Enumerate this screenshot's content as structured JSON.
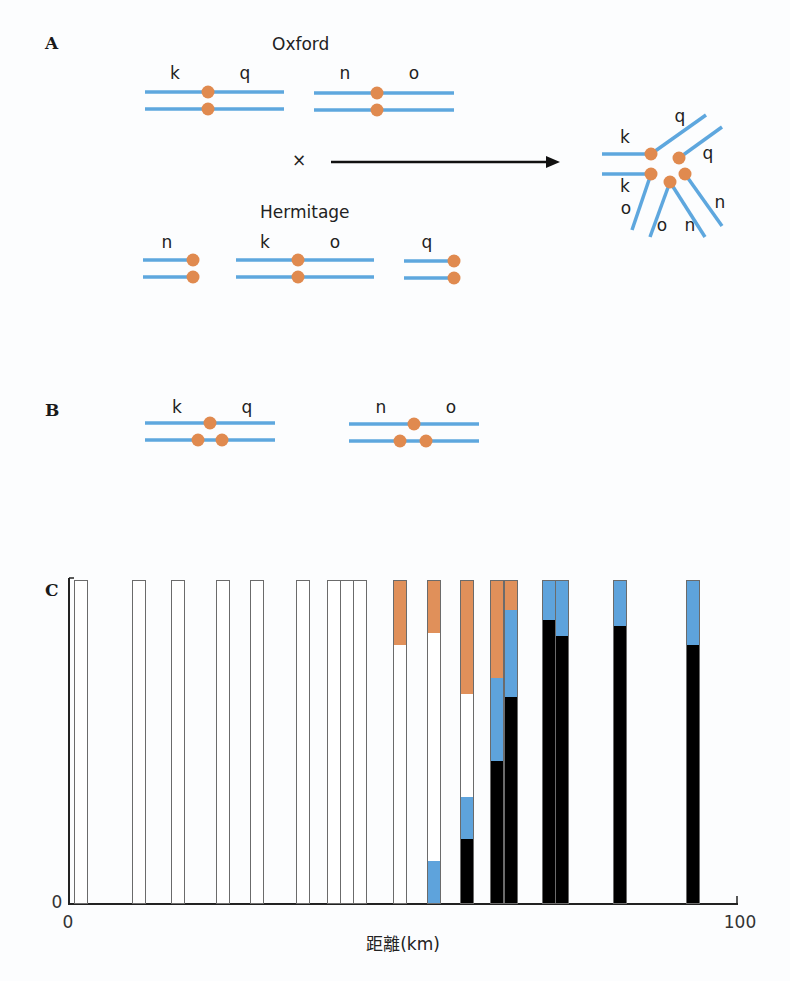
{
  "panels": {
    "A": {
      "label": "A",
      "oxford": {
        "title": "Oxford",
        "chromosome_pairs": [
          {
            "left_gene": "k",
            "right_gene": "q"
          },
          {
            "left_gene": "n",
            "right_gene": "o"
          }
        ]
      },
      "cross_symbol": "×",
      "hermitage": {
        "title": "Hermitage",
        "chromosome_pairs": [
          {
            "left_gene": "n"
          },
          {
            "left_gene": "k",
            "right_gene": "o"
          },
          {
            "left_gene": "q"
          }
        ]
      },
      "hybrid_labels": {
        "k1": "k",
        "k2": "k",
        "q1": "q",
        "q2": "q",
        "o1": "o",
        "o2": "o",
        "n1": "n",
        "n2": "n"
      }
    },
    "B": {
      "label": "B",
      "chromosome_pairs": [
        {
          "left_gene": "k",
          "right_gene": "q"
        },
        {
          "left_gene": "n",
          "right_gene": "o"
        }
      ]
    },
    "C": {
      "label": "C"
    }
  },
  "colors": {
    "chromosome_blue": "#5ea7de",
    "centromere_orange": "#e08a4f",
    "bar_orange": "#e0905a",
    "bar_blue": "#5ea3dc",
    "bar_black": "#000000",
    "bar_white": "#ffffff"
  },
  "chart_data": {
    "type": "bar",
    "stacked": true,
    "title": "",
    "xlabel": "距離(km)",
    "ylabel": "",
    "xlim": [
      0,
      100
    ],
    "ylim": [
      0,
      1
    ],
    "x_ticks": [
      "0",
      "100"
    ],
    "y_ticks": [
      "0"
    ],
    "segment_order_bottom_to_top": [
      "black",
      "blue",
      "white",
      "orange"
    ],
    "series_colors": {
      "black": "#000000",
      "blue": "#5ea3dc",
      "white": "#ffffff",
      "orange": "#e0905a"
    },
    "bars": [
      {
        "x": 1.8,
        "black": 0,
        "blue": 0,
        "white": 1.0,
        "orange": 0
      },
      {
        "x": 10.5,
        "black": 0,
        "blue": 0,
        "white": 1.0,
        "orange": 0
      },
      {
        "x": 16.3,
        "black": 0,
        "blue": 0,
        "white": 1.0,
        "orange": 0
      },
      {
        "x": 23.0,
        "black": 0,
        "blue": 0,
        "white": 1.0,
        "orange": 0
      },
      {
        "x": 28.1,
        "black": 0,
        "blue": 0,
        "white": 1.0,
        "orange": 0
      },
      {
        "x": 35.0,
        "black": 0,
        "blue": 0,
        "white": 1.0,
        "orange": 0
      },
      {
        "x": 39.6,
        "black": 0,
        "blue": 0,
        "white": 1.0,
        "orange": 0
      },
      {
        "x": 41.6,
        "black": 0,
        "blue": 0,
        "white": 1.0,
        "orange": 0
      },
      {
        "x": 43.5,
        "black": 0,
        "blue": 0,
        "white": 1.0,
        "orange": 0
      },
      {
        "x": 49.6,
        "black": 0,
        "blue": 0,
        "white": 0.8,
        "orange": 0.2
      },
      {
        "x": 54.7,
        "black": 0,
        "blue": 0.13,
        "white": 0.71,
        "orange": 0.16
      },
      {
        "x": 59.6,
        "black": 0.2,
        "blue": 0.13,
        "white": 0.32,
        "orange": 0.35
      },
      {
        "x": 64.1,
        "black": 0.44,
        "blue": 0.26,
        "white": 0,
        "orange": 0.3
      },
      {
        "x": 66.1,
        "black": 0.64,
        "blue": 0.27,
        "white": 0,
        "orange": 0.09
      },
      {
        "x": 71.9,
        "black": 0.88,
        "blue": 0.12,
        "white": 0,
        "orange": 0
      },
      {
        "x": 73.8,
        "black": 0.83,
        "blue": 0.17,
        "white": 0,
        "orange": 0
      },
      {
        "x": 82.5,
        "black": 0.86,
        "blue": 0.14,
        "white": 0,
        "orange": 0
      },
      {
        "x": 93.4,
        "black": 0.8,
        "blue": 0.2,
        "white": 0,
        "orange": 0
      }
    ]
  }
}
